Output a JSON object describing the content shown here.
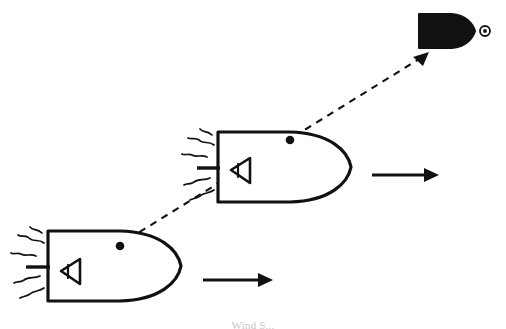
{
  "figure": {
    "background_color": "#ffffff",
    "ink_color": "#111111",
    "width": 506,
    "height": 329,
    "caption_partial": "Wind S..."
  },
  "objects": {
    "lower_ship": {
      "label": "lower-outlined-spacecraft",
      "style": "outline",
      "center": {
        "x": 113,
        "y": 266
      },
      "hull": {
        "stern_x": 48,
        "bow_x": 182,
        "top_y": 231,
        "bottom_y": 301
      },
      "marker_dot": {
        "x": 120,
        "y": 246
      },
      "sensor_symbol": "triangle-left",
      "sensor_position": {
        "x": 70,
        "y": 271
      },
      "emission_lines": 5,
      "velocity_arrow": {
        "label": "lower-velocity-arrow",
        "direction": "right",
        "x1": 203,
        "y1": 280,
        "x2": 272,
        "y2": 280
      }
    },
    "upper_ship": {
      "label": "upper-outlined-spacecraft",
      "style": "outline",
      "center": {
        "x": 283,
        "y": 167
      },
      "hull": {
        "stern_x": 218,
        "bow_x": 352,
        "top_y": 132,
        "bottom_y": 202
      },
      "marker_dot": {
        "x": 290,
        "y": 140
      },
      "sensor_symbol": "triangle-left",
      "sensor_position": {
        "x": 240,
        "y": 170
      },
      "emission_lines": 5,
      "velocity_arrow": {
        "label": "upper-velocity-arrow",
        "direction": "right",
        "x1": 372,
        "y1": 175,
        "x2": 438,
        "y2": 175
      }
    },
    "target_ship": {
      "label": "filled-black-spacecraft",
      "style": "solid-fill",
      "center": {
        "x": 447,
        "y": 31
      },
      "hull": {
        "stern_x": 419,
        "bow_x": 475,
        "top_y": 14,
        "bottom_y": 48
      },
      "nose_marker": {
        "label": "target-ring-marker",
        "x": 485,
        "y": 31,
        "outer_r": 5,
        "inner_r": 2
      }
    }
  },
  "connectors": {
    "sight_line": {
      "label": "dashed-line-of-sight",
      "style": "dashed",
      "dash_pattern": "7 6",
      "x1": 62,
      "y1": 280,
      "x2": 426,
      "y2": 55
    },
    "sight_arrowhead": {
      "label": "sight-line-arrowhead",
      "x": 428,
      "y": 53,
      "angle_deg": -31
    }
  }
}
